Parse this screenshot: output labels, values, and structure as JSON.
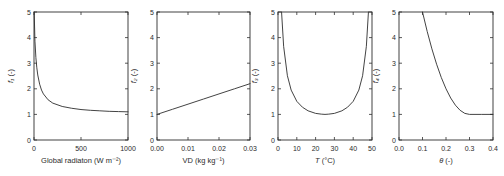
{
  "figure": {
    "background": "#ffffff",
    "line_color": "#2e2e2e",
    "text_color": "#2b2b2b"
  },
  "chart_data": [
    {
      "name": "f1-vs-global-radiation",
      "type": "line",
      "xlabel_var": "Global radiaton",
      "xlabel_var_italic": false,
      "xlabel_unit": "(W m⁻²)",
      "ylabel_var": "f₁",
      "ylabel_var_italic": true,
      "ylabel_unit": "(-)",
      "xlim": [
        0,
        1000
      ],
      "ylim": [
        0,
        5
      ],
      "xticks": [
        0,
        500,
        1000
      ],
      "xtick_labels": [
        "0",
        "500",
        "1000"
      ],
      "yticks": [
        0,
        1,
        2,
        3,
        4,
        5
      ],
      "ytick_labels": [
        "0",
        "1",
        "2",
        "3",
        "4",
        "5"
      ],
      "x": [
        2,
        10,
        20,
        30,
        40,
        60,
        80,
        100,
        150,
        200,
        300,
        400,
        500,
        600,
        700,
        800,
        900,
        1000
      ],
      "y": [
        5.0,
        3.86,
        3.22,
        2.82,
        2.54,
        2.18,
        1.95,
        1.8,
        1.57,
        1.44,
        1.31,
        1.24,
        1.19,
        1.16,
        1.14,
        1.12,
        1.11,
        1.1
      ]
    },
    {
      "name": "f2-vs-vapour-deficit",
      "type": "line",
      "xlabel_var": "VD",
      "xlabel_var_italic": false,
      "xlabel_unit": "(kg kg⁻¹)",
      "ylabel_var": "f₂",
      "ylabel_var_italic": true,
      "ylabel_unit": "(-)",
      "xlim": [
        0,
        0.03
      ],
      "ylim": [
        0,
        5
      ],
      "xticks": [
        0,
        0.01,
        0.02,
        0.03
      ],
      "xtick_labels": [
        "0.00",
        "0.01",
        "0.02",
        "0.03"
      ],
      "yticks": [
        0,
        1,
        2,
        3,
        4,
        5
      ],
      "ytick_labels": [
        "0",
        "1",
        "2",
        "3",
        "4",
        "5"
      ],
      "x": [
        0,
        0.005,
        0.01,
        0.015,
        0.02,
        0.025,
        0.03
      ],
      "y": [
        1.0,
        1.2,
        1.4,
        1.6,
        1.8,
        2.0,
        2.2
      ]
    },
    {
      "name": "f3-vs-temperature",
      "type": "line",
      "xlabel_var": "T",
      "xlabel_var_italic": true,
      "xlabel_unit": "(°C)",
      "ylabel_var": "f₃",
      "ylabel_var_italic": true,
      "ylabel_unit": "(-)",
      "xlim": [
        0,
        50
      ],
      "ylim": [
        0,
        5
      ],
      "xticks": [
        0,
        10,
        20,
        30,
        40,
        50
      ],
      "xtick_labels": [
        "0",
        "10",
        "20",
        "30",
        "40",
        "50"
      ],
      "yticks": [
        0,
        1,
        2,
        3,
        4,
        5
      ],
      "ytick_labels": [
        "0",
        "1",
        "2",
        "3",
        "4",
        "5"
      ],
      "x": [
        1.9,
        3,
        5,
        7,
        10,
        13,
        16,
        20,
        23,
        25,
        27,
        30,
        34,
        37,
        40,
        43,
        45,
        47,
        48.1
      ],
      "y": [
        5.0,
        3.66,
        2.51,
        1.95,
        1.51,
        1.28,
        1.14,
        1.04,
        1.01,
        1.0,
        1.01,
        1.04,
        1.14,
        1.28,
        1.51,
        1.95,
        2.51,
        3.66,
        5.0
      ]
    },
    {
      "name": "f4-vs-soil-moisture",
      "type": "line",
      "xlabel_var": "θ",
      "xlabel_var_italic": true,
      "xlabel_unit": "(-)",
      "ylabel_var": "f₄",
      "ylabel_var_italic": true,
      "ylabel_unit": "(-)",
      "xlim": [
        0,
        0.4
      ],
      "ylim": [
        0,
        5
      ],
      "xticks": [
        0,
        0.1,
        0.2,
        0.3,
        0.4
      ],
      "xtick_labels": [
        "0.0",
        "0.1",
        "0.2",
        "0.3",
        "0.4"
      ],
      "yticks": [
        0,
        1,
        2,
        3,
        4,
        5
      ],
      "ytick_labels": [
        "0",
        "1",
        "2",
        "3",
        "4",
        "5"
      ],
      "x": [
        0.1,
        0.12,
        0.14,
        0.16,
        0.18,
        0.2,
        0.22,
        0.24,
        0.26,
        0.28,
        0.3,
        0.35,
        0.4
      ],
      "y": [
        5.0,
        4.24,
        3.56,
        2.96,
        2.44,
        2.0,
        1.64,
        1.36,
        1.16,
        1.04,
        1.0,
        1.0,
        1.0
      ]
    }
  ]
}
